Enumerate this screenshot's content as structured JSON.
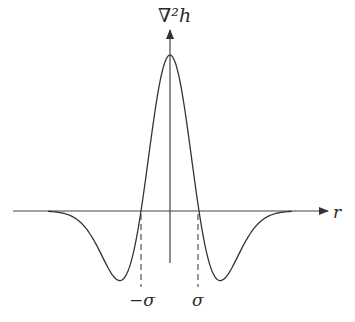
{
  "figure": {
    "y_axis_label": "∇²h",
    "x_axis_label": "r",
    "tick_labels": {
      "neg_sigma": "−σ",
      "pos_sigma": "σ"
    },
    "curve_description": "Laplacian of Gaussian (Mexican hat), inverted sign: positive peak at r=0, zero crossings at ±σ, negative lobes beyond",
    "colors": {
      "stroke": "#333333",
      "background": "#ffffff"
    }
  },
  "chart_data": {
    "type": "line",
    "title": "",
    "xlabel": "r",
    "ylabel": "∇²h",
    "x_ticks": [
      "−σ",
      "σ"
    ],
    "grid": false,
    "legend": "none",
    "series": [
      {
        "name": "∇²h",
        "x_in_sigma": [
          -4,
          -3,
          -2.5,
          -2,
          -1.73,
          -1.5,
          -1,
          -0.5,
          0,
          0.5,
          1,
          1.5,
          1.73,
          2,
          2.5,
          3,
          4
        ],
        "y_relative": [
          -0.003,
          -0.089,
          -0.225,
          -0.406,
          -0.446,
          -0.405,
          0.0,
          0.662,
          1.0,
          0.662,
          0.0,
          -0.405,
          -0.446,
          -0.406,
          -0.225,
          -0.089,
          -0.003
        ]
      }
    ]
  }
}
